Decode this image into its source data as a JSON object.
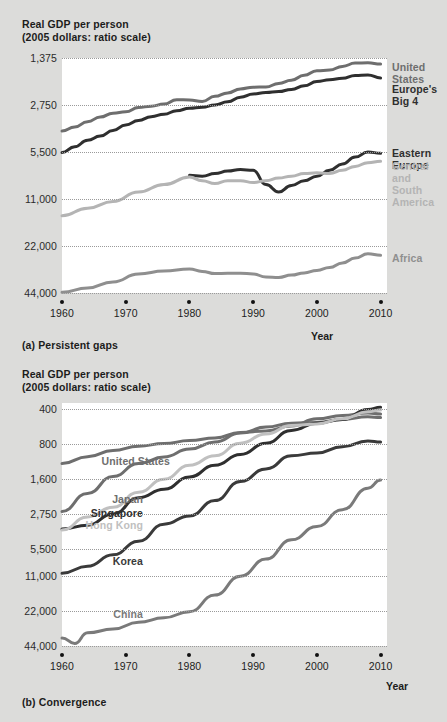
{
  "page": {
    "background": "#dcdcda",
    "plot_background": "#ffffff"
  },
  "panels": [
    {
      "id": "a",
      "axis_title": "Real GDP per person\n(2005 dollars: ratio scale)",
      "caption": "(a) Persistent gaps",
      "xaxis_word": "Year",
      "yticks": [
        "44,000",
        "22,000",
        "11,000",
        "5,500",
        "2,750",
        "1,375"
      ],
      "xticks": [
        "1960",
        "1970",
        "1980",
        "1990",
        "2000",
        "2010"
      ],
      "series_labels": [
        {
          "name": "United States",
          "text": "United States",
          "color": "#6e6e6e"
        },
        {
          "name": "Europe's Big 4",
          "text": "Europe's Big 4",
          "color": "#2f2f2f"
        },
        {
          "name": "Eastern Europe",
          "text": "Eastern Europe",
          "color": "#2f2f2f"
        },
        {
          "name": "Central and South America",
          "text": "Central and\nSouth America",
          "color": "#b4b4b4"
        },
        {
          "name": "Africa",
          "text": "Africa",
          "color": "#8f8f8f"
        }
      ]
    },
    {
      "id": "b",
      "axis_title": "Real GDP per person\n(2005 dollars: ratio scale)",
      "caption": "(b) Convergence",
      "xaxis_word": "Year",
      "yticks": [
        "44,000",
        "22,000",
        "11,000",
        "5,500",
        "2,750",
        "1,600",
        "800",
        "400"
      ],
      "xticks": [
        "1960",
        "1970",
        "1980",
        "1990",
        "2000",
        "2010"
      ],
      "series_labels": [
        {
          "name": "United States",
          "text": "United States",
          "color": "#6e6e6e"
        },
        {
          "name": "Japan",
          "text": "Japan",
          "color": "#6e6e6e"
        },
        {
          "name": "Singapore",
          "text": "Singapore",
          "color": "#2f2f2f"
        },
        {
          "name": "Hong Kong",
          "text": "Hong Kong",
          "color": "#c0c0c0"
        },
        {
          "name": "Korea",
          "text": "Korea",
          "color": "#3a3a3a"
        },
        {
          "name": "China",
          "text": "China",
          "color": "#7a7a7a"
        }
      ]
    }
  ],
  "chart_data": [
    {
      "type": "line",
      "title": "(a) Persistent gaps",
      "ylabel": "Real GDP per person (2005 dollars: ratio scale)",
      "xlabel": "Year",
      "scale": "log",
      "ylim": [
        1375,
        44000
      ],
      "yticks": [
        1375,
        2750,
        5500,
        11000,
        22000,
        44000
      ],
      "xlim": [
        1960,
        2011
      ],
      "xticks": [
        1960,
        1970,
        1980,
        1990,
        2000,
        2010
      ],
      "grid": true,
      "legend": "inline-right",
      "series": [
        {
          "name": "United States",
          "color": "#6e6e6e",
          "x": [
            1960,
            1962,
            1964,
            1966,
            1968,
            1970,
            1972,
            1974,
            1976,
            1978,
            1980,
            1982,
            1984,
            1986,
            1988,
            1990,
            1992,
            1994,
            1996,
            1998,
            2000,
            2002,
            2004,
            2006,
            2008,
            2010
          ],
          "values": [
            15000,
            15900,
            17200,
            18400,
            19500,
            19900,
            21200,
            21600,
            22300,
            23800,
            23700,
            23200,
            25000,
            26300,
            27900,
            28600,
            28700,
            30200,
            31700,
            34100,
            36500,
            36800,
            38900,
            40800,
            41000,
            40200
          ]
        },
        {
          "name": "Europe's Big 4",
          "color": "#2f2f2f",
          "x": [
            1960,
            1962,
            1964,
            1966,
            1968,
            1970,
            1972,
            1974,
            1976,
            1978,
            1980,
            1982,
            1984,
            1986,
            1988,
            1990,
            1992,
            1994,
            1996,
            1998,
            2000,
            2002,
            2004,
            2006,
            2008,
            2010
          ],
          "values": [
            10900,
            11900,
            13100,
            13900,
            15100,
            16400,
            17500,
            18500,
            19200,
            20200,
            21000,
            21300,
            22000,
            23100,
            24700,
            25900,
            26400,
            26800,
            27700,
            29200,
            31100,
            31900,
            32600,
            34000,
            34300,
            32800
          ]
        },
        {
          "name": "Eastern Europe",
          "color": "#2f2f2f",
          "x": [
            1980,
            1982,
            1984,
            1986,
            1988,
            1990,
            1992,
            1994,
            1996,
            1998,
            2000,
            2002,
            2004,
            2006,
            2008,
            2010
          ],
          "values": [
            7800,
            7700,
            8000,
            8300,
            8500,
            8400,
            6800,
            6100,
            6700,
            7200,
            7700,
            8400,
            9200,
            10200,
            11000,
            10800
          ]
        },
        {
          "name": "Central and South America",
          "color": "#b4b4b4",
          "x": [
            1960,
            1964,
            1968,
            1972,
            1976,
            1980,
            1982,
            1984,
            1986,
            1988,
            1990,
            1992,
            1994,
            1996,
            1998,
            2000,
            2002,
            2004,
            2006,
            2008,
            2010
          ],
          "values": [
            4300,
            4800,
            5300,
            6100,
            6800,
            7600,
            7200,
            6900,
            7200,
            7200,
            7000,
            7200,
            7500,
            7700,
            8000,
            8100,
            8000,
            8400,
            8900,
            9400,
            9600
          ]
        },
        {
          "name": "Africa",
          "color": "#8f8f8f",
          "x": [
            1960,
            1964,
            1968,
            1972,
            1976,
            1980,
            1982,
            1984,
            1986,
            1988,
            1990,
            1992,
            1994,
            1996,
            1998,
            2000,
            2002,
            2004,
            2006,
            2008,
            2010
          ],
          "values": [
            1390,
            1480,
            1620,
            1820,
            1900,
            1960,
            1890,
            1830,
            1840,
            1840,
            1820,
            1740,
            1730,
            1790,
            1850,
            1920,
            2000,
            2140,
            2300,
            2450,
            2400
          ]
        }
      ]
    },
    {
      "type": "line",
      "title": "(b) Convergence",
      "ylabel": "Real GDP per person (2005 dollars: ratio scale)",
      "xlabel": "Year",
      "scale": "log",
      "ylim": [
        400,
        50000
      ],
      "yticks": [
        400,
        800,
        1600,
        2750,
        5500,
        11000,
        22000,
        44000
      ],
      "xlim": [
        1960,
        2011
      ],
      "xticks": [
        1960,
        1970,
        1980,
        1990,
        2000,
        2010
      ],
      "grid": true,
      "legend": "inline-left",
      "series": [
        {
          "name": "United States",
          "color": "#6e6e6e",
          "x": [
            1960,
            1964,
            1968,
            1972,
            1976,
            1980,
            1984,
            1988,
            1992,
            1996,
            2000,
            2004,
            2008,
            2010
          ],
          "values": [
            15000,
            17200,
            19500,
            21200,
            22300,
            23700,
            25000,
            27900,
            28700,
            31700,
            36500,
            38900,
            41000,
            40200
          ]
        },
        {
          "name": "Japan",
          "color": "#6e6e6e",
          "x": [
            1960,
            1964,
            1968,
            1972,
            1976,
            1980,
            1984,
            1988,
            1992,
            1996,
            2000,
            2004,
            2008,
            2010
          ],
          "values": [
            5800,
            8300,
            11600,
            15000,
            17100,
            20000,
            23000,
            27500,
            31000,
            33500,
            34000,
            36000,
            38000,
            37500
          ]
        },
        {
          "name": "Singapore",
          "color": "#2f2f2f",
          "x": [
            1960,
            1964,
            1968,
            1972,
            1976,
            1980,
            1984,
            1988,
            1992,
            1996,
            2000,
            2004,
            2008,
            2010
          ],
          "values": [
            4100,
            4400,
            5500,
            7600,
            9000,
            11500,
            14500,
            18000,
            22500,
            29000,
            33500,
            36000,
            44000,
            46000
          ]
        },
        {
          "name": "Hong Kong",
          "color": "#c0c0c0",
          "x": [
            1960,
            1964,
            1968,
            1972,
            1976,
            1980,
            1984,
            1988,
            1992,
            1996,
            2000,
            2004,
            2008,
            2010
          ],
          "values": [
            4000,
            5200,
            6300,
            8500,
            11000,
            14500,
            17500,
            22500,
            27000,
            32000,
            33000,
            36500,
            42000,
            43500
          ]
        },
        {
          "name": "Korea",
          "color": "#3a3a3a",
          "x": [
            1960,
            1964,
            1968,
            1972,
            1976,
            1980,
            1984,
            1988,
            1992,
            1996,
            2000,
            2004,
            2008,
            2010
          ],
          "values": [
            1700,
            1950,
            2450,
            3200,
            4500,
            5300,
            7200,
            10500,
            13500,
            17500,
            18500,
            21000,
            23500,
            23000
          ]
        },
        {
          "name": "China",
          "color": "#7a7a7a",
          "x": [
            1960,
            1962,
            1964,
            1968,
            1972,
            1976,
            1980,
            1984,
            1988,
            1992,
            1996,
            2000,
            2004,
            2008,
            2010
          ],
          "values": [
            470,
            420,
            520,
            560,
            640,
            700,
            790,
            1100,
            1600,
            2250,
            3300,
            4300,
            6000,
            9200,
            10800
          ]
        }
      ]
    }
  ]
}
